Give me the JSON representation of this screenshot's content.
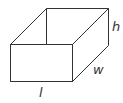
{
  "diagram": {
    "labels": {
      "length": "l",
      "width": "w",
      "height": "h"
    },
    "stroke_color": "#333333",
    "background": "#ffffff"
  }
}
